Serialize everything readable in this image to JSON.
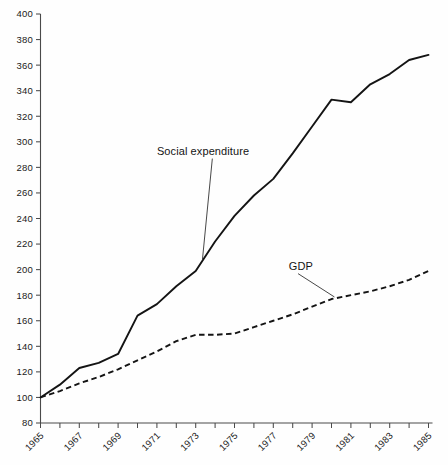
{
  "chart_data": {
    "type": "line",
    "title": "",
    "subtitle": "",
    "xlabel": "",
    "ylabel": "",
    "xlim": [
      1965,
      1985
    ],
    "ylim": [
      80,
      400
    ],
    "grid": false,
    "legend_position": "inline-annotations",
    "x": [
      1965,
      1966,
      1967,
      1968,
      1969,
      1970,
      1971,
      1972,
      1973,
      1974,
      1975,
      1976,
      1977,
      1978,
      1979,
      1980,
      1981,
      1982,
      1983,
      1984,
      1985
    ],
    "y_ticks": [
      80,
      100,
      120,
      140,
      160,
      180,
      200,
      220,
      240,
      260,
      280,
      300,
      320,
      340,
      360,
      380,
      400
    ],
    "y_tick_labels": [
      "80",
      "100",
      "120",
      "140",
      "160",
      "180",
      "200",
      "220",
      "240",
      "260",
      "280",
      "300",
      "320",
      "340",
      "360",
      "380",
      "400"
    ],
    "x_ticks": [
      1965,
      1966,
      1967,
      1968,
      1969,
      1970,
      1971,
      1972,
      1973,
      1974,
      1975,
      1976,
      1977,
      1978,
      1979,
      1980,
      1981,
      1982,
      1983,
      1984,
      1985
    ],
    "x_tick_labels": [
      "1965",
      "",
      "1967",
      "",
      "1969",
      "",
      "1971",
      "",
      "1973",
      "",
      "1975",
      "",
      "1977",
      "",
      "1979",
      "",
      "1981",
      "",
      "1983",
      "",
      "1985"
    ],
    "x_tick_labels_shown": [
      "1965",
      "1967",
      "1969",
      "1971",
      "1973",
      "1975",
      "1977",
      "1979",
      "1981",
      "1983",
      "1985"
    ],
    "series": [
      {
        "name": "Social expenditure",
        "style": "solid",
        "color": "#141414",
        "values": [
          100,
          110,
          123,
          127,
          134,
          164,
          173,
          187,
          199,
          222,
          242,
          258,
          271,
          291,
          312,
          333,
          331,
          345,
          353,
          364,
          368
        ]
      },
      {
        "name": "GDP",
        "style": "dashed",
        "color": "#141414",
        "values": [
          100,
          105,
          111,
          116,
          122,
          129,
          136,
          144,
          149,
          149,
          150,
          155,
          160,
          165,
          171,
          177,
          180,
          183,
          187,
          192,
          199
        ]
      }
    ],
    "annotations": [
      {
        "text": "Social expenditure",
        "series": "Social expenditure",
        "x": 1971,
        "y": 290
      },
      {
        "text": "GDP",
        "series": "GDP",
        "x": 1977.8,
        "y": 200
      }
    ]
  }
}
